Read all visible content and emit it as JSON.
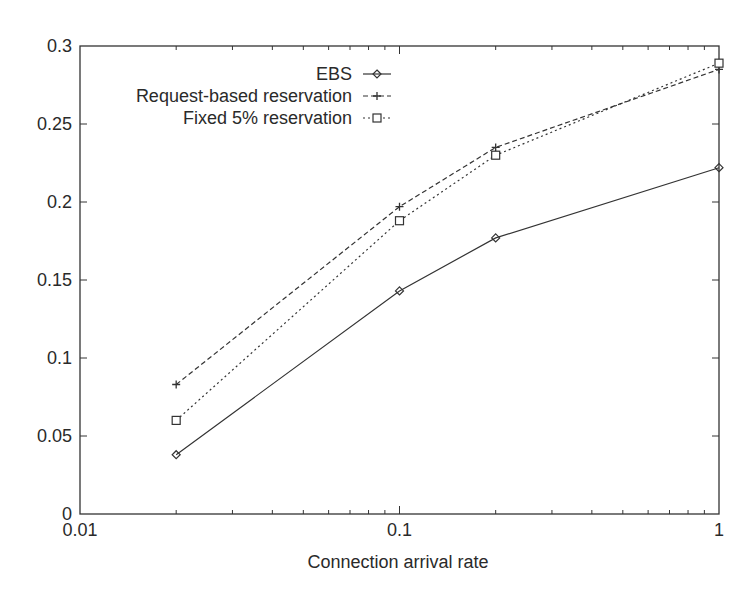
{
  "chart_data": {
    "type": "line",
    "title": "",
    "xlabel": "Connection arrival rate",
    "ylabel": "",
    "xscale": "log",
    "xlim": [
      0.01,
      1
    ],
    "ylim": [
      0,
      0.3
    ],
    "grid": false,
    "legend_position": "upper-center-left",
    "x": [
      0.02,
      0.1,
      0.2,
      1
    ],
    "x_ticks": [
      0.01,
      0.1,
      1
    ],
    "x_tick_labels": [
      "0.01",
      "0.1",
      "1"
    ],
    "y_ticks": [
      0,
      0.05,
      0.1,
      0.15,
      0.2,
      0.25,
      0.3
    ],
    "y_tick_labels": [
      "0",
      "0.05",
      "0.1",
      "0.15",
      "0.2",
      "0.25",
      "0.3"
    ],
    "series": [
      {
        "name": "EBS",
        "marker": "diamond",
        "line": "solid",
        "values": [
          0.038,
          0.143,
          0.177,
          0.222
        ]
      },
      {
        "name": "Request-based reservation",
        "marker": "plus",
        "line": "dashed",
        "values": [
          0.083,
          0.197,
          0.235,
          0.285
        ]
      },
      {
        "name": "Fixed 5% reservation",
        "marker": "square",
        "line": "dotted",
        "values": [
          0.06,
          0.188,
          0.23,
          0.289
        ]
      }
    ]
  },
  "colors": {
    "axis": "#333333",
    "text": "#2a2a2a",
    "series": "#333333"
  }
}
